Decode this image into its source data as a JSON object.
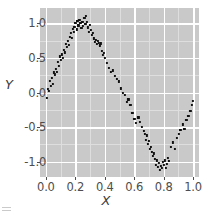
{
  "chart_data": {
    "type": "scatter",
    "title": "",
    "subtitle": "",
    "xlabel": "X",
    "ylabel": "Y",
    "xlim": [
      -0.04,
      1.04
    ],
    "ylim": [
      -1.22,
      1.22
    ],
    "xticks": [
      0.0,
      0.2,
      0.4,
      0.6,
      0.8,
      1.0
    ],
    "xtick_labels": [
      "0.0",
      "0.2",
      "0.4",
      "0.6",
      "0.8",
      "1.0"
    ],
    "yticks": [
      -1.0,
      -0.5,
      0.0,
      0.5,
      1.0
    ],
    "ytick_labels": [
      "-1.0",
      "-0.5",
      "0.0",
      "0.5",
      "1.0"
    ],
    "xminor": [
      0.1,
      0.3,
      0.5,
      0.7,
      0.9
    ],
    "yminor": [
      -0.75,
      -0.25,
      0.25,
      0.75
    ],
    "grid": true,
    "legend": "none",
    "panel_background": "#c9c9c9",
    "gridline_major_color": "#ffffff",
    "gridline_minor_color": "#dedede",
    "point_color": "#111111",
    "point_size": 2.2,
    "marker": "square",
    "series": [
      {
        "name": "points",
        "x": [
          0.005,
          0.012,
          0.02,
          0.028,
          0.034,
          0.041,
          0.048,
          0.053,
          0.061,
          0.068,
          0.074,
          0.081,
          0.088,
          0.094,
          0.101,
          0.108,
          0.114,
          0.121,
          0.128,
          0.134,
          0.141,
          0.148,
          0.154,
          0.161,
          0.168,
          0.174,
          0.181,
          0.188,
          0.194,
          0.201,
          0.208,
          0.214,
          0.221,
          0.228,
          0.234,
          0.241,
          0.248,
          0.254,
          0.261,
          0.268,
          0.274,
          0.281,
          0.288,
          0.294,
          0.301,
          0.308,
          0.314,
          0.321,
          0.328,
          0.334,
          0.341,
          0.348,
          0.354,
          0.361,
          0.368,
          0.374,
          0.381,
          0.388,
          0.394,
          0.401,
          0.414,
          0.428,
          0.441,
          0.454,
          0.468,
          0.481,
          0.494,
          0.508,
          0.521,
          0.534,
          0.548,
          0.561,
          0.574,
          0.588,
          0.601,
          0.614,
          0.628,
          0.641,
          0.654,
          0.668,
          0.674,
          0.681,
          0.688,
          0.694,
          0.701,
          0.708,
          0.714,
          0.721,
          0.728,
          0.734,
          0.741,
          0.748,
          0.754,
          0.761,
          0.768,
          0.774,
          0.781,
          0.788,
          0.794,
          0.801,
          0.808,
          0.814,
          0.821,
          0.828,
          0.834,
          0.848,
          0.861,
          0.874,
          0.888,
          0.901,
          0.914,
          0.928,
          0.941,
          0.954,
          0.968,
          0.981,
          0.994,
          1.0
        ],
        "y": [
          -0.08,
          0.05,
          0.02,
          0.17,
          0.1,
          0.21,
          0.12,
          0.29,
          0.26,
          0.34,
          0.3,
          0.44,
          0.38,
          0.52,
          0.47,
          0.55,
          0.5,
          0.62,
          0.58,
          0.7,
          0.66,
          0.74,
          0.69,
          0.8,
          0.86,
          0.79,
          0.92,
          0.88,
          0.95,
          1.0,
          0.91,
          1.03,
          0.97,
          1.05,
          1.0,
          0.93,
          1.02,
          0.96,
          1.08,
          0.99,
          1.1,
          1.02,
          0.94,
          0.88,
          0.98,
          0.9,
          0.83,
          0.86,
          0.78,
          0.73,
          0.76,
          0.7,
          0.74,
          0.72,
          0.68,
          0.71,
          0.6,
          0.54,
          0.57,
          0.5,
          0.43,
          0.35,
          0.3,
          0.32,
          0.24,
          0.2,
          0.16,
          0.06,
          0.0,
          -0.04,
          -0.14,
          -0.1,
          -0.18,
          -0.3,
          -0.38,
          -0.44,
          -0.36,
          -0.42,
          -0.5,
          -0.56,
          -0.6,
          -0.68,
          -0.62,
          -0.74,
          -0.7,
          -0.82,
          -0.78,
          -0.86,
          -0.92,
          -0.88,
          -0.96,
          -1.04,
          -0.98,
          -1.08,
          -1.02,
          -1.12,
          -1.06,
          -1.09,
          -1.0,
          -1.05,
          -0.98,
          -1.09,
          -1.03,
          -0.94,
          -0.99,
          -0.78,
          -0.72,
          -0.82,
          -0.66,
          -0.6,
          -0.54,
          -0.46,
          -0.52,
          -0.4,
          -0.34,
          -0.26,
          -0.18,
          -0.12
        ]
      }
    ]
  },
  "artifact": {
    "name": "cropped-glyph",
    "description": "faint gray mark at bottom-left edge"
  }
}
